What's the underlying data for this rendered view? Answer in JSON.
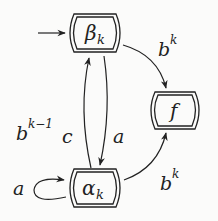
{
  "diagram": {
    "type": "state-machine",
    "nodes": [
      {
        "id": "beta",
        "label": "β",
        "subscript": "k",
        "initial": true
      },
      {
        "id": "f",
        "label": "f",
        "subscript": "",
        "initial": false
      },
      {
        "id": "alpha",
        "label": "α",
        "subscript": "k",
        "initial": false
      }
    ],
    "edges": [
      {
        "from": "beta",
        "to": "f",
        "label": "b",
        "sup": "k"
      },
      {
        "from": "alpha",
        "to": "beta",
        "label": "b",
        "sup": "k−1",
        "suffix": "c"
      },
      {
        "from": "beta",
        "to": "alpha",
        "label": "a",
        "sup": "",
        "suffix": ""
      },
      {
        "from": "alpha",
        "to": "alpha",
        "label": "a",
        "sup": "",
        "suffix": ""
      },
      {
        "from": "alpha",
        "to": "f",
        "label": "b",
        "sup": "k"
      }
    ]
  },
  "colors": {
    "ink": "#222222",
    "background": "#fbfbfa"
  }
}
